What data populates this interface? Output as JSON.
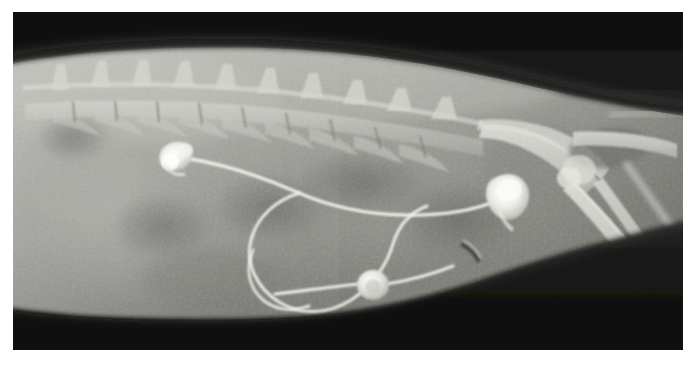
{
  "image": {
    "kind": "medical-radiograph",
    "modality": "X-ray",
    "projection": "lateral",
    "subject": "feline abdomen and lumbar spine",
    "caption": "",
    "border_color": "#ffffff",
    "plate": {
      "left": 13,
      "top": 12,
      "width": 670,
      "height": 338,
      "background_color": "#0d0d0d"
    }
  },
  "tones": {
    "background_dark": "#141414",
    "collimation_black": "#0a0a0a",
    "soft_tissue_mid": "#8a8a86",
    "soft_tissue_light": "#a9a9a4",
    "bone_bright": "#d8d8d2",
    "implant_white": "#f2f2ee",
    "gas_dark": "#5a5a58"
  },
  "anatomy": {
    "regions": [
      {
        "name": "dorsal-collimation-band",
        "label": "Dark collimated field above the back"
      },
      {
        "name": "lumbar-spine",
        "label": "Lumbar vertebral column",
        "vertebrae_visible": 9
      },
      {
        "name": "abdominal-soft-tissue",
        "label": "Abdominal soft tissue mass"
      },
      {
        "name": "pelvis",
        "label": "Pelvic girdle"
      },
      {
        "name": "femur",
        "label": "Femur"
      },
      {
        "name": "tibia-fibula",
        "label": "Tibia and fibula"
      },
      {
        "name": "ventral-abdominal-wall",
        "label": "Ventral abdominal contour"
      },
      {
        "name": "ventral-collimation-band",
        "label": "Dark collimated field below the abdomen"
      }
    ]
  },
  "implant": {
    "name": "subcutaneous-ureteral-bypass-device",
    "label": "Radiopaque catheter and port assembly",
    "components": [
      {
        "name": "nephrostomy-locking-loop",
        "label": "Upper radiopaque locking loop",
        "cx": 162,
        "cy": 143
      },
      {
        "name": "catheter-tubing-upper",
        "label": "Catheter tubing running caudally"
      },
      {
        "name": "catheter-loop-large",
        "label": "Large redundant catheter loop in ventral abdomen"
      },
      {
        "name": "subcutaneous-port",
        "label": "Subcutaneous access port disc",
        "cx": 360,
        "cy": 273
      },
      {
        "name": "cystostomy-tip",
        "label": "Bladder catheter tip anchor",
        "cx": 492,
        "cy": 180
      }
    ]
  },
  "chart_data": null
}
